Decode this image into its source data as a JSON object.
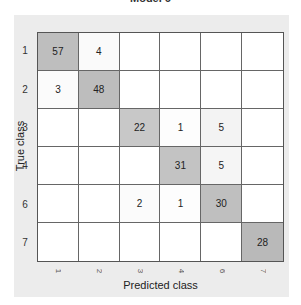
{
  "chart_data": {
    "type": "heatmap",
    "title": "Model 6",
    "xlabel": "Predicted class",
    "ylabel": "True class",
    "row_labels": [
      "1",
      "2",
      "3",
      "4",
      "6",
      "7"
    ],
    "col_labels": [
      "1",
      "2",
      "3",
      "4",
      "6",
      "7"
    ],
    "values": [
      [
        57,
        4,
        null,
        null,
        null,
        null
      ],
      [
        3,
        48,
        null,
        null,
        null,
        null
      ],
      [
        null,
        null,
        22,
        1,
        5,
        null
      ],
      [
        null,
        null,
        null,
        31,
        5,
        null
      ],
      [
        null,
        null,
        2,
        1,
        30,
        null
      ],
      [
        null,
        null,
        null,
        null,
        null,
        28
      ]
    ],
    "colormap": "white-to-grey",
    "max_value": 57
  }
}
